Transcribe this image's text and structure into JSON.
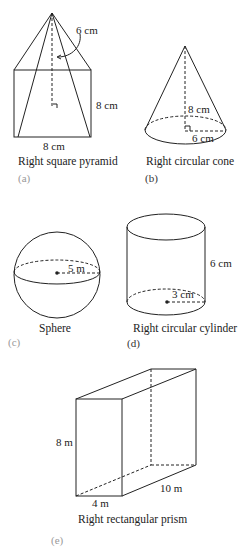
{
  "figures": {
    "a": {
      "caption": "Right square pyramid",
      "tag": "(a)",
      "slant_label": "6 cm",
      "height_label": "8 cm",
      "base_label": "8 cm"
    },
    "b": {
      "caption": "Right circular cone",
      "tag": "(b)",
      "height_label": "8 cm",
      "radius_label": "6 cm"
    },
    "c": {
      "caption": "Sphere",
      "tag": "(c)",
      "radius_label": "5 m"
    },
    "d": {
      "caption": "Right circular cylinder",
      "tag": "(d)",
      "height_label": "6 cm",
      "radius_label": "3 cm"
    },
    "e": {
      "caption": "Right rectangular prism",
      "tag": "(e)",
      "height_label": "8 m",
      "width_label": "4 m",
      "depth_label": "10 m"
    }
  }
}
